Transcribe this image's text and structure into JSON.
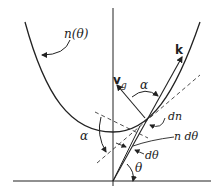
{
  "diagram": {
    "type": "refractive-index-surface",
    "labels": {
      "curve": "n(θ)",
      "wave_vector": "k",
      "group_velocity": "v",
      "group_velocity_sub": "g",
      "alpha_top": "α",
      "alpha_left": "α",
      "dn": "dn",
      "n_dtheta": "n dθ",
      "dtheta": "dθ",
      "theta": "θ"
    },
    "colors": {
      "ink": "#222222",
      "background": "#ffffff"
    }
  }
}
